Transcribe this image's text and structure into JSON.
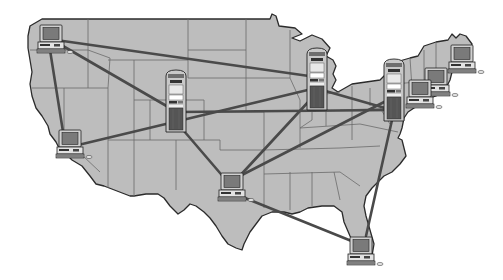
{
  "figure": {
    "title": "Network of computers and servers across the United States",
    "map_region": "Contiguous United States",
    "colors": {
      "land": "#bdbdbd",
      "state_border": "#6b6b6b",
      "coast": "#2b2b2b",
      "link": "#4a4a4a",
      "background": "#ffffff"
    }
  },
  "servers": [
    {
      "id": "server-mountain",
      "label": "Server (Colorado/Nebraska)"
    },
    {
      "id": "server-midwest",
      "label": "Server (Illinois/Indiana)"
    },
    {
      "id": "server-east",
      "label": "Server (Pennsylvania/New Jersey)"
    }
  ],
  "workstations": [
    {
      "id": "pc-seattle",
      "label": "Workstation (Pacific Northwest)"
    },
    {
      "id": "pc-california",
      "label": "Workstation (Southern California)"
    },
    {
      "id": "pc-texas",
      "label": "Workstation (Texas)"
    },
    {
      "id": "pc-florida",
      "label": "Workstation (Florida)"
    },
    {
      "id": "pc-ne-1",
      "label": "Workstation (New England 1)"
    },
    {
      "id": "pc-ne-2",
      "label": "Workstation (New England 2)"
    },
    {
      "id": "pc-ne-3",
      "label": "Workstation (New England 3)"
    }
  ],
  "links": [
    [
      "pc-seattle",
      "server-midwest"
    ],
    [
      "pc-seattle",
      "server-mountain"
    ],
    [
      "pc-seattle",
      "pc-california"
    ],
    [
      "pc-california",
      "server-midwest"
    ],
    [
      "server-mountain",
      "server-east"
    ],
    [
      "server-mountain",
      "pc-texas"
    ],
    [
      "server-midwest",
      "pc-texas"
    ],
    [
      "server-midwest",
      "server-east"
    ],
    [
      "pc-texas",
      "server-east"
    ],
    [
      "pc-texas",
      "pc-florida"
    ],
    [
      "server-east",
      "pc-florida"
    ]
  ]
}
